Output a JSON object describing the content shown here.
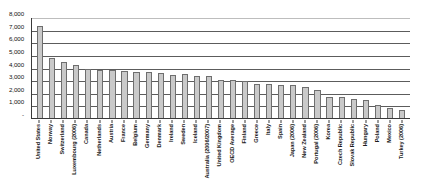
{
  "chart_data": {
    "type": "bar",
    "title": "",
    "subtitle": "",
    "xlabel": "",
    "ylabel": "",
    "ylim": [
      0,
      8000
    ],
    "ytick_values": [
      0,
      1000,
      2000,
      3000,
      4000,
      5000,
      6000,
      7000,
      8000
    ],
    "ytick_labels": [
      "-",
      "1,000",
      "2,000",
      "3,000",
      "4,000",
      "5,000",
      "6,000",
      "7,000",
      "8,000"
    ],
    "grid": true,
    "legend": "none",
    "orientation": "vertical",
    "bar_color": "#c9c9c9",
    "bar_border_color": "#6e6e6e",
    "axis_color": "#3a3a3a",
    "gridline_color": "#5c5c5c",
    "categories": [
      "United States",
      "Norway",
      "Switzerland",
      "Luxembourg (2006)",
      "Canada",
      "Netherlands",
      "Austria",
      "France",
      "Belgium",
      "Germany",
      "Denmark",
      "Ireland",
      "Sweden",
      "Iceland",
      "Australia (2006/2007)",
      "United Kingdom",
      "OECD Average",
      "Finland",
      "Greece",
      "Italy",
      "Spain",
      "Japan (2006)",
      "New Zealand",
      "Portugal (2006)",
      "Korea",
      "Czech Republic",
      "Slovak Republic",
      "Hungary",
      "Poland",
      "Mexico",
      "Turkey (2006)"
    ],
    "values": [
      7290,
      4760,
      4420,
      4160,
      3900,
      3840,
      3820,
      3700,
      3680,
      3640,
      3540,
      3420,
      3470,
      3310,
      3360,
      3000,
      3000,
      2900,
      2720,
      2690,
      2630,
      2580,
      2490,
      2180,
      1700,
      1680,
      1520,
      1400,
      1070,
      830,
      620
    ]
  }
}
